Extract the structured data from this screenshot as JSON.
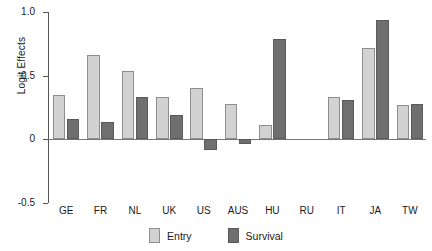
{
  "chart_data": {
    "type": "bar",
    "title": "",
    "xlabel": "",
    "ylabel": "Logit Effects",
    "ylim": [
      -0.5,
      1.0
    ],
    "yticks": [
      "1.0",
      "0.5",
      "0",
      "-0.5"
    ],
    "ytick_values": [
      1.0,
      0.5,
      0.0,
      -0.5
    ],
    "grid": false,
    "legend_position": "bottom-center",
    "categories": [
      "GE",
      "FR",
      "NL",
      "UK",
      "US",
      "AUS",
      "HU",
      "RU",
      "IT",
      "JA",
      "TW"
    ],
    "series": [
      {
        "name": "Entry",
        "color": "#d2d2d2",
        "values": [
          0.35,
          0.66,
          0.54,
          0.33,
          0.4,
          0.28,
          0.11,
          0.0,
          0.33,
          0.72,
          0.27
        ]
      },
      {
        "name": "Survival",
        "color": "#6f6f6f",
        "values": [
          0.16,
          0.14,
          0.33,
          0.19,
          -0.08,
          -0.04,
          0.79,
          0.0,
          0.31,
          0.94,
          0.28
        ]
      }
    ]
  },
  "legend": {
    "items": [
      {
        "label": "Entry",
        "swatch": "entry-swatch"
      },
      {
        "label": "Survival",
        "swatch": "survival-swatch"
      }
    ]
  }
}
